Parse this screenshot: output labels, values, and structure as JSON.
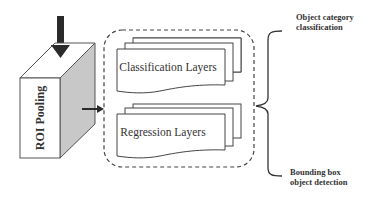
{
  "diagram": {
    "roi_block": {
      "label": "ROI Pooling"
    },
    "layer_group": {
      "classification_label": "Classification Layers",
      "regression_label": "Regression Layers"
    },
    "outputs": {
      "top_line1": "Object category",
      "top_line2": "classification",
      "bottom_line1": "Bounding box",
      "bottom_line2": "object detection"
    },
    "colors": {
      "stroke": "#3a3a3a",
      "arrow": "#2a2a2a",
      "side_face": "#c8c8c8",
      "front_face": "#ffffff",
      "text": "#333333"
    }
  }
}
